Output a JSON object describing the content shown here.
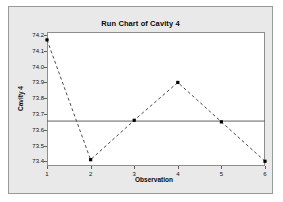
{
  "chart_data": {
    "type": "line",
    "title": "Run Chart of Cavity 4",
    "xlabel": "Observation",
    "ylabel": "Cavity 4",
    "x": [
      1,
      2,
      3,
      4,
      5,
      6
    ],
    "values": [
      74.17,
      73.41,
      73.66,
      73.9,
      73.65,
      73.4
    ],
    "series": [
      {
        "name": "Cavity 4",
        "values": [
          74.17,
          73.41,
          73.66,
          73.9,
          73.65,
          73.4
        ]
      }
    ],
    "categories": [
      "1",
      "2",
      "3",
      "4",
      "5",
      "6"
    ],
    "xlim": [
      1,
      6
    ],
    "ylim": [
      73.37,
      74.22
    ],
    "xticks": [
      "1",
      "2",
      "3",
      "4",
      "5",
      "6"
    ],
    "yticks": [
      "73.4",
      "73.5",
      "73.6",
      "73.7",
      "73.8",
      "73.9",
      "74.0",
      "74.1",
      "74.2"
    ],
    "ytick_values": [
      73.4,
      73.5,
      73.6,
      73.7,
      73.8,
      73.9,
      74.0,
      74.1,
      74.2
    ],
    "grid": false,
    "legend": "none",
    "reference_line": {
      "name": "median-line",
      "value": 73.655,
      "style": "solid"
    },
    "line_style": "dashed",
    "marker": "square",
    "colors": {
      "line": "#4a4a4a",
      "marker": "#000000",
      "reference_line": "#606060",
      "plot_background": "#ffffff",
      "panel_background": "#e9e9e9",
      "axis": "#8d8d8d",
      "text": "#0a0a0a"
    }
  }
}
